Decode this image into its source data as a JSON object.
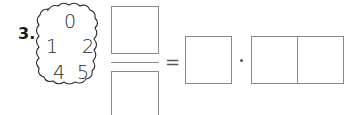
{
  "exercise": {
    "number_label": "3.",
    "digit_cloud": {
      "digits": [
        "0",
        "1",
        "2",
        "4",
        "5"
      ]
    },
    "equation": {
      "fraction": {
        "numerator_box": "",
        "denominator_box": ""
      },
      "equals_sign": "=",
      "result_box": "",
      "multiply_sign": "·",
      "two_digit_boxes": [
        "",
        ""
      ]
    }
  },
  "colors": {
    "box_border": "#8a8a8a",
    "text": "#2a2a2a"
  }
}
